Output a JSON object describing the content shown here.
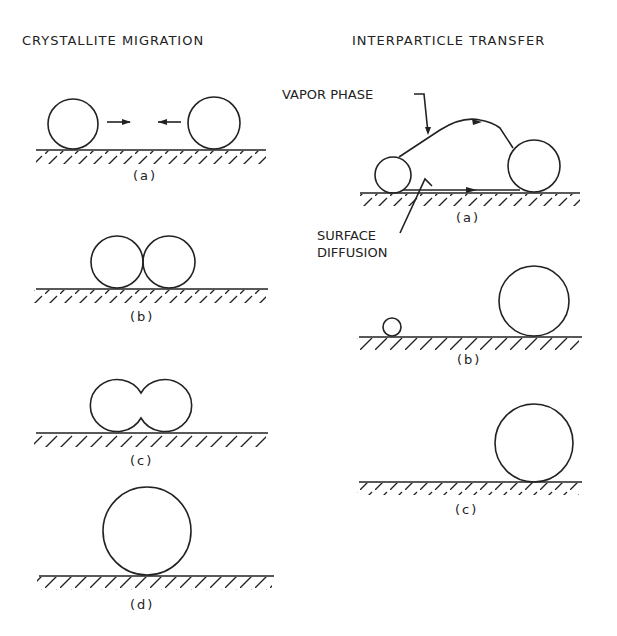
{
  "titles": {
    "left": "CRYSTALLITE    MIGRATION",
    "right": "INTERPARTICLE  TRANSFER"
  },
  "labels": {
    "vapor_phase": "VAPOR PHASE",
    "surface_diffusion_1": "SURFACE",
    "surface_diffusion_2": "DIFFUSION"
  },
  "left_panels": [
    {
      "caption": "(a)"
    },
    {
      "caption": "(b)"
    },
    {
      "caption": "(c)"
    },
    {
      "caption": "(d)"
    }
  ],
  "right_panels": [
    {
      "caption": "(a)"
    },
    {
      "caption": "(b)"
    },
    {
      "caption": "(c)"
    }
  ],
  "colors": {
    "ink": "#222222",
    "background": "#ffffff"
  }
}
